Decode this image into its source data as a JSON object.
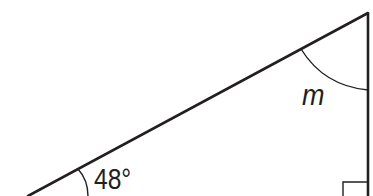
{
  "diagram": {
    "type": "right-triangle",
    "labels": {
      "known_angle": "48°",
      "unknown_angle": "m"
    },
    "right_angle_marker": true,
    "colors": {
      "stroke": "#231f20",
      "background": "#ffffff"
    }
  }
}
